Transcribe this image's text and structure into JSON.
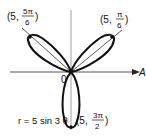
{
  "figure": {
    "equation": "r = 5 sin 3 θ",
    "origin_label": "0",
    "axis_label": "A",
    "points": [
      {
        "id": "upper-left",
        "prefix": "(5,",
        "num": "5π",
        "den": "6",
        "suffix": ")"
      },
      {
        "id": "upper-right",
        "prefix": "(5,",
        "num": "π",
        "den": "6",
        "suffix": ")"
      },
      {
        "id": "bottom",
        "prefix": "(5,",
        "num": "3π",
        "den": "2",
        "suffix": ")"
      }
    ],
    "colors": {
      "curve": "#111111",
      "axis": "#555555",
      "ray": "#333333"
    }
  }
}
